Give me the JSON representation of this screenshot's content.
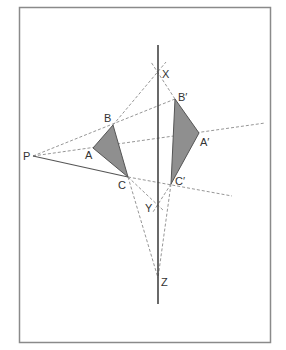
{
  "diagram": {
    "type": "reflection-construction",
    "frame": {
      "x": 19,
      "y": 7,
      "width": 251,
      "height": 335,
      "stroke": "#8a8a8a"
    },
    "mirror_line": {
      "x": 158,
      "y1": 45,
      "y2": 304,
      "stroke": "#444444"
    },
    "colors": {
      "triangle_fill": "#8f8f8f",
      "triangle_stroke": "#555555",
      "dash": "#8a8a8a"
    },
    "points": {
      "P": {
        "label": "P",
        "x": 33,
        "y": 156
      },
      "A": {
        "label": "A",
        "x": 93,
        "y": 148
      },
      "B": {
        "label": "B",
        "x": 113,
        "y": 125
      },
      "C": {
        "label": "C",
        "x": 128,
        "y": 177
      },
      "A_prime": {
        "label": "A′",
        "x": 199,
        "y": 133
      },
      "B_prime": {
        "label": "B′",
        "x": 175,
        "y": 99
      },
      "C_prime": {
        "label": "C′",
        "x": 171,
        "y": 184
      },
      "X": {
        "label": "X",
        "x": 158,
        "y": 71
      },
      "Y": {
        "label": "Y",
        "x": 158,
        "y": 206
      },
      "Z": {
        "label": "Z",
        "x": 158,
        "y": 278
      }
    },
    "labels": {
      "P": "P",
      "A": "A",
      "B": "B",
      "C": "C",
      "A_prime": "A′",
      "B_prime": "B′",
      "C_prime": "C′",
      "X": "X",
      "Y": "Y",
      "Z": "Z"
    },
    "triangles": [
      {
        "name": "ABC",
        "vertices": [
          "A",
          "B",
          "C"
        ]
      },
      {
        "name": "A′B′C′",
        "vertices": [
          "A′",
          "B′",
          "C′"
        ]
      }
    ]
  }
}
